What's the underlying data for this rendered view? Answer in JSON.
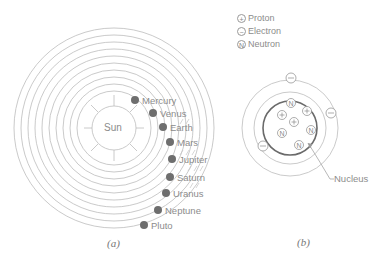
{
  "panel_a": {
    "caption": "(a)",
    "sun_label": "Sun",
    "planets": [
      {
        "name": "Mercury",
        "x": 135,
        "y": 100
      },
      {
        "name": "Venus",
        "x": 153,
        "y": 113
      },
      {
        "name": "Earth",
        "x": 163,
        "y": 127
      },
      {
        "name": "Mars",
        "x": 170,
        "y": 142
      },
      {
        "name": "Jupiter",
        "x": 172,
        "y": 159
      },
      {
        "name": "Saturn",
        "x": 170,
        "y": 177
      },
      {
        "name": "Uranus",
        "x": 166,
        "y": 193
      },
      {
        "name": "Neptune",
        "x": 158,
        "y": 210
      },
      {
        "name": "Pluto",
        "x": 144,
        "y": 225
      }
    ]
  },
  "panel_b": {
    "caption": "(b)",
    "legend": [
      {
        "symbol": "+",
        "label": "Proton"
      },
      {
        "symbol": "−",
        "label": "Electron"
      },
      {
        "symbol": "N",
        "label": "Neutron"
      }
    ],
    "nucleus_label": "Nucleus"
  },
  "colors": {
    "line": "#b8b8b8",
    "planet": "#6e6e6e",
    "nucleus_ring": "#6a6a6a",
    "text": "#8c8c8c"
  }
}
